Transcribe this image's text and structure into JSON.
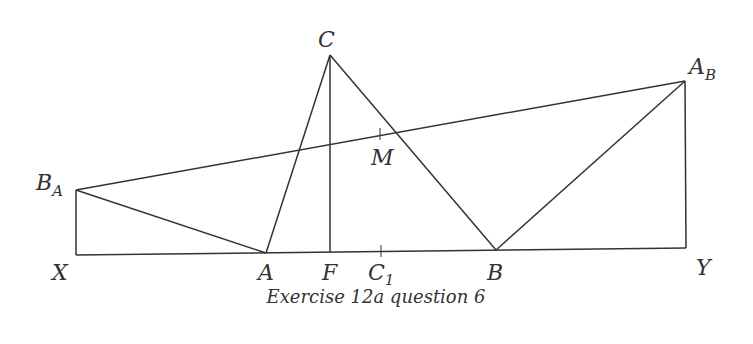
{
  "caption": "Exercise 12a question 6",
  "points": {
    "X": {
      "label": "X",
      "sub": "",
      "x": 76,
      "y": 255
    },
    "B_A": {
      "label": "B",
      "sub": "A",
      "x": 76,
      "y": 190
    },
    "A": {
      "label": "A",
      "sub": "",
      "x": 266,
      "y": 253
    },
    "F": {
      "label": "F",
      "sub": "",
      "x": 330,
      "y": 252
    },
    "C": {
      "label": "C",
      "sub": "",
      "x": 330,
      "y": 55
    },
    "C1": {
      "label": "C",
      "sub": "1",
      "x": 381,
      "y": 251
    },
    "M": {
      "label": "M",
      "sub": "",
      "x": 380,
      "y": 134
    },
    "B": {
      "label": "B",
      "sub": "",
      "x": 496,
      "y": 250
    },
    "A_B": {
      "label": "A",
      "sub": "B",
      "x": 685,
      "y": 81
    },
    "Y": {
      "label": "Y",
      "sub": "",
      "x": 686,
      "y": 248
    }
  },
  "segments": [
    [
      "X",
      "Y"
    ],
    [
      "X",
      "B_A"
    ],
    [
      "B_A",
      "A"
    ],
    [
      "B_A",
      "A_B"
    ],
    [
      "A",
      "C"
    ],
    [
      "C",
      "F"
    ],
    [
      "C",
      "B"
    ],
    [
      "B",
      "A_B"
    ],
    [
      "A_B",
      "Y"
    ]
  ],
  "ticks": [
    "M",
    "C1"
  ]
}
